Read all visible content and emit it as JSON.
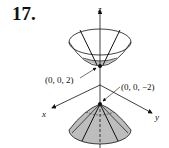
{
  "problem_number": "17.",
  "axes": {
    "x": "x",
    "y": "y",
    "z": "z"
  },
  "labels": {
    "upper_vertex": "(0, 0, 2)",
    "lower_vertex": "(0, 0, −2)"
  },
  "colors": {
    "fill": "#bdbdbd",
    "stroke": "#111111"
  }
}
